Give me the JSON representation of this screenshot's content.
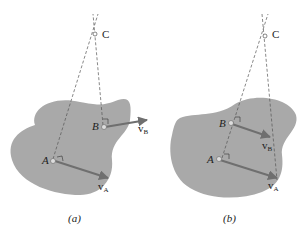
{
  "figures": [
    {
      "caption": "(a)",
      "points": {
        "A": "A",
        "B": "B",
        "C": "C"
      },
      "velocities": {
        "vA": "v",
        "vA_sub": "A",
        "vB": "v",
        "vB_sub": "B"
      }
    },
    {
      "caption": "(b)",
      "points": {
        "A": "A",
        "B": "B",
        "C": "C"
      },
      "velocities": {
        "vA": "v",
        "vA_sub": "A",
        "vB": "v",
        "vB_sub": "B"
      }
    }
  ],
  "colors": {
    "body": "#a9a9a9",
    "arrow": "#6f6f6f",
    "line": "#555555"
  }
}
